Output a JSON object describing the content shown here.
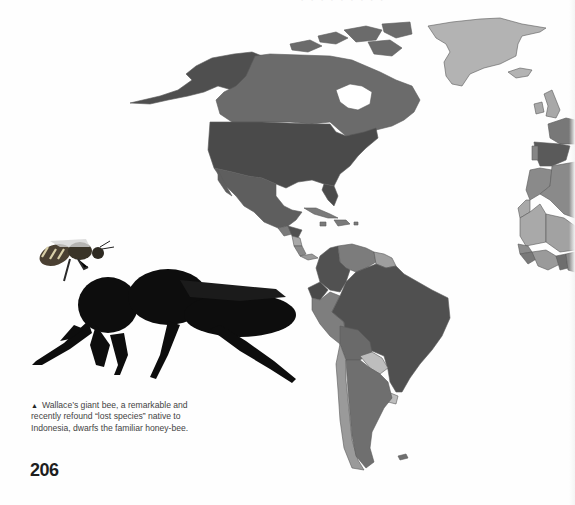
{
  "page": {
    "number": "206",
    "top_text_cropped": "· · · · · · · · ·"
  },
  "caption": {
    "marker": "▲",
    "text": "Wallace’s giant bee, a remarkable and recently refound “lost species” native to Indonesia, dwarfs the familiar honey-bee."
  },
  "images": {
    "honey_bee": "honey-bee",
    "giant_bee": "wallace-giant-bee"
  },
  "map": {
    "colors": {
      "darkest": "#4a4a4a",
      "dark": "#5c5c5c",
      "medium": "#6e6e6e",
      "medium_light": "#8a8a8a",
      "light": "#a8a8a8",
      "lightest": "#bdbdbd",
      "background": "#ffffff"
    },
    "regions": [
      "Alaska",
      "Canada",
      "Greenland",
      "United States",
      "Mexico",
      "Central America",
      "Caribbean",
      "South America",
      "Europe",
      "Africa"
    ]
  }
}
